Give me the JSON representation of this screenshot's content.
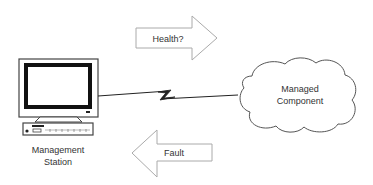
{
  "diagram": {
    "nodes": [
      {
        "id": "management-station",
        "label_lines": [
          "Management",
          "Station"
        ],
        "icon": "computer-workstation-icon"
      },
      {
        "id": "managed-component",
        "label_lines": [
          "Managed",
          "Component"
        ],
        "icon": "cloud-icon"
      }
    ],
    "messages": [
      {
        "id": "health",
        "label": "Health?",
        "direction": "right"
      },
      {
        "id": "fault",
        "label": "Fault",
        "direction": "left"
      }
    ],
    "link": {
      "type": "lightning-link",
      "from": "management-station",
      "to": "managed-component"
    }
  },
  "colors": {
    "stroke": "#555555",
    "arrow_stroke": "#aaaaaa",
    "text": "#333333",
    "background": "#ffffff"
  }
}
